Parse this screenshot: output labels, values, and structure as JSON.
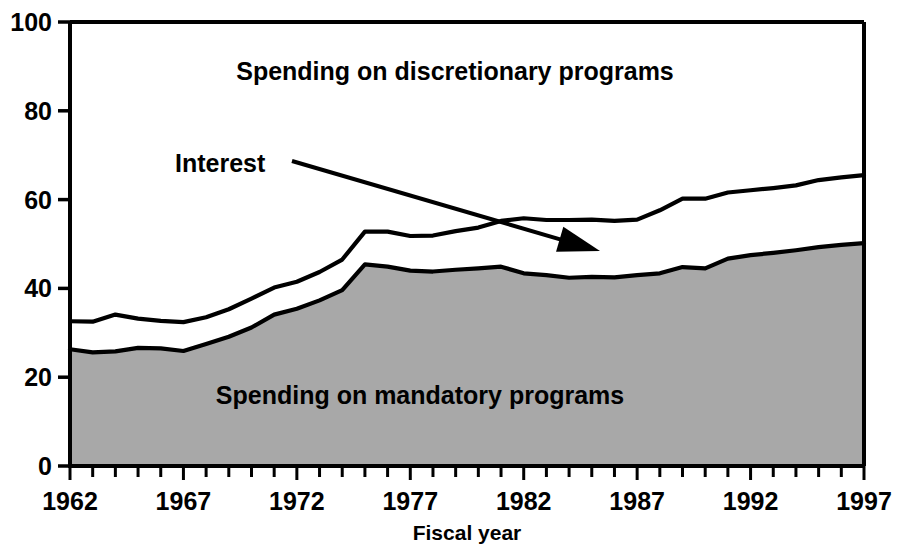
{
  "chart_data": {
    "type": "area",
    "title": "",
    "subtitle": "",
    "xlabel": "Fiscal year",
    "ylabel": "",
    "stacked": true,
    "grid": false,
    "legend_position": "inline-annotations",
    "xlim": [
      1962,
      1997
    ],
    "ylim": [
      0,
      100
    ],
    "ytick_labels": [
      "0",
      "20",
      "40",
      "60",
      "80",
      "100"
    ],
    "ytick_values": [
      0,
      20,
      40,
      60,
      80,
      100
    ],
    "xtick_labels": [
      "1962",
      "1967",
      "1972",
      "1977",
      "1982",
      "1987",
      "1992",
      "1997"
    ],
    "xtick_values": [
      1962,
      1967,
      1972,
      1977,
      1982,
      1987,
      1992,
      1997
    ],
    "x_minor_tick_step": 1,
    "x": [
      1962,
      1963,
      1964,
      1965,
      1966,
      1967,
      1968,
      1969,
      1970,
      1971,
      1972,
      1973,
      1974,
      1975,
      1976,
      1977,
      1978,
      1979,
      1980,
      1981,
      1982,
      1983,
      1984,
      1985,
      1986,
      1987,
      1988,
      1989,
      1990,
      1991,
      1992,
      1993,
      1994,
      1995,
      1996,
      1997
    ],
    "series": [
      {
        "name": "Spending on mandatory programs",
        "fill_color": "#a8a8a8",
        "line_color": "#000000",
        "values": [
          26.3,
          25.6,
          25.8,
          26.6,
          26.5,
          25.9,
          27.5,
          29.1,
          31.2,
          34.1,
          35.4,
          37.3,
          39.6,
          45.4,
          44.9,
          44.0,
          43.8,
          44.2,
          44.5,
          44.9,
          43.4,
          43.0,
          42.4,
          42.6,
          42.5,
          43.0,
          43.4,
          44.8,
          44.5,
          46.7,
          47.5,
          48.0,
          48.6,
          49.3,
          49.8,
          50.2
        ]
      },
      {
        "name": "Interest",
        "fill_color": "#ffffff",
        "line_color": "#000000",
        "values": [
          6.3,
          6.9,
          8.3,
          6.6,
          6.2,
          6.5,
          6.0,
          6.2,
          6.5,
          6.1,
          6.1,
          6.4,
          6.9,
          7.4,
          7.9,
          7.8,
          8.1,
          8.7,
          9.2,
          10.3,
          12.4,
          12.4,
          13.0,
          12.9,
          12.7,
          12.5,
          14.2,
          15.4,
          15.7,
          14.9,
          14.6,
          14.6,
          14.6,
          15.1,
          15.2,
          15.3
        ]
      },
      {
        "name": "Spending on discretionary programs",
        "fill_color": "#ffffff",
        "line_color": "#000000",
        "values": [
          67.4,
          67.5,
          65.9,
          66.8,
          67.3,
          67.6,
          66.5,
          64.7,
          62.3,
          59.8,
          58.5,
          56.3,
          53.5,
          47.2,
          47.2,
          48.2,
          48.1,
          47.1,
          46.3,
          44.8,
          44.2,
          44.6,
          44.6,
          44.5,
          44.8,
          44.5,
          42.4,
          39.8,
          39.8,
          38.4,
          37.9,
          37.4,
          36.8,
          35.6,
          35.0,
          34.5
        ]
      }
    ],
    "cumulative_boundaries": {
      "mandatory_top": [
        26.3,
        25.6,
        25.8,
        26.6,
        26.5,
        25.9,
        27.5,
        29.1,
        31.2,
        34.1,
        35.4,
        37.3,
        39.6,
        45.4,
        44.9,
        44.0,
        43.8,
        44.2,
        44.5,
        44.9,
        43.4,
        43.0,
        42.4,
        42.6,
        42.5,
        43.0,
        43.4,
        44.8,
        44.5,
        46.7,
        47.5,
        48.0,
        48.6,
        49.3,
        49.8,
        50.2
      ],
      "interest_top": [
        32.6,
        32.5,
        34.1,
        33.2,
        32.7,
        32.4,
        33.5,
        35.3,
        37.7,
        40.2,
        41.5,
        43.7,
        46.5,
        52.8,
        52.8,
        51.8,
        51.9,
        52.9,
        53.7,
        55.2,
        55.8,
        55.4,
        55.4,
        55.5,
        55.2,
        55.5,
        57.6,
        60.2,
        60.2,
        61.6,
        62.1,
        62.6,
        63.2,
        64.4,
        65.0,
        65.5
      ]
    },
    "annotations": [
      {
        "name": "interest-callout",
        "text": "Interest",
        "text_x": 175,
        "text_y": 172,
        "arrow_from": [
          292,
          161
        ],
        "arrow_to": [
          600,
          251
        ]
      },
      {
        "name": "discretionary-inline-label",
        "text": "Spending on discretionary programs",
        "text_x": 455,
        "text_y": 80
      },
      {
        "name": "mandatory-inline-label",
        "text": "Spending on mandatory programs",
        "text_x": 420,
        "text_y": 404
      }
    ],
    "colors": {
      "mandatory_fill": "#a8a8a8",
      "interest_fill": "#ffffff",
      "discretionary_fill": "#ffffff",
      "axis": "#000000",
      "text": "#000000",
      "background": "#ffffff"
    }
  },
  "labels": {
    "discretionary": "Spending on discretionary programs",
    "mandatory": "Spending on mandatory programs",
    "interest": "Interest",
    "x_axis_title": "Fiscal year"
  },
  "y_ticks": [
    "100",
    "80",
    "60",
    "40",
    "20",
    "0"
  ],
  "x_ticks": [
    "1962",
    "1967",
    "1972",
    "1977",
    "1982",
    "1987",
    "1992",
    "1997"
  ]
}
